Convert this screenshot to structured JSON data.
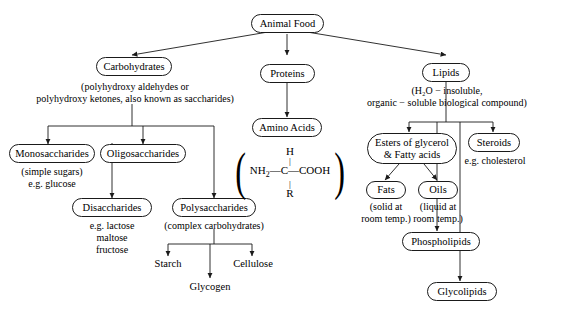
{
  "diagram": {
    "root": {
      "label": "Animal Food"
    },
    "branches": {
      "carbohydrates": {
        "label": "Carbohydrates",
        "caption_line1": "(polyhydroxy aldehydes or",
        "caption_line2": "polyhydroxy ketones, also known as saccharides)",
        "children": {
          "monosaccharides": {
            "label": "Monosaccharides",
            "caption_line1": "(simple sugars)",
            "caption_line2": "e.g. glucose"
          },
          "oligosaccharides": {
            "label": "Oligosaccharides"
          },
          "disaccharides": {
            "label": "Disaccharides",
            "caption_line1": "e.g. lactose",
            "caption_line2": "maltose",
            "caption_line3": "fructose"
          },
          "polysaccharides": {
            "label": "Polysaccharides",
            "caption": "(complex carbohydrates)",
            "products": {
              "starch": "Starch",
              "glycogen": "Glycogen",
              "cellulose": "Cellulose"
            }
          }
        }
      },
      "proteins": {
        "label": "Proteins",
        "amino_acids": {
          "label": "Amino Acids"
        },
        "amino_acid_formula": {
          "top_atom": "H",
          "left_group": "NH",
          "left_group_sub": "2",
          "center_atom": "C",
          "right_group": "COOH",
          "bottom_atom": "R",
          "bond_dash": "—",
          "bond_vertical": "|",
          "paren_left": "(",
          "paren_right": ")"
        }
      },
      "lipids": {
        "label": "Lipids",
        "caption_line1": "(H₂O − insoluble,",
        "caption_line2": "organic − soluble biological compound)",
        "children": {
          "esters": {
            "label_line1": "Esters of glycerol",
            "label_line2": "& Fatty acids",
            "fats": {
              "label": "Fats",
              "caption_line1": "(solid at",
              "caption_line2": "room temp.)"
            },
            "oils": {
              "label": "Oils",
              "caption_line1": "(liquid at",
              "caption_line2": "room temp.)"
            }
          },
          "phospholipids": {
            "label": "Phospholipids"
          },
          "glycolipids": {
            "label": "Glycolipids"
          },
          "steroids": {
            "label": "Steroids",
            "caption": "e.g. cholesterol"
          }
        }
      }
    },
    "style": {
      "line_color": "#1a1a1a",
      "background": "#ffffff",
      "text_color": "#000000"
    }
  }
}
